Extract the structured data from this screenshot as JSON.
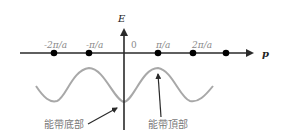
{
  "diagram": {
    "axes": {
      "vertical_label": "E",
      "horizontal_label": "p"
    },
    "ticks": [
      "-2π/a",
      "-π/a",
      "0",
      "π/a",
      "2π/a"
    ],
    "annotations": {
      "band_bottom": "能帶底部",
      "band_top": "能帶頂部"
    },
    "colors": {
      "axis": "#2a2a2a",
      "curve": "#a8a8a8",
      "tick_text": "#8a8a8a"
    }
  }
}
